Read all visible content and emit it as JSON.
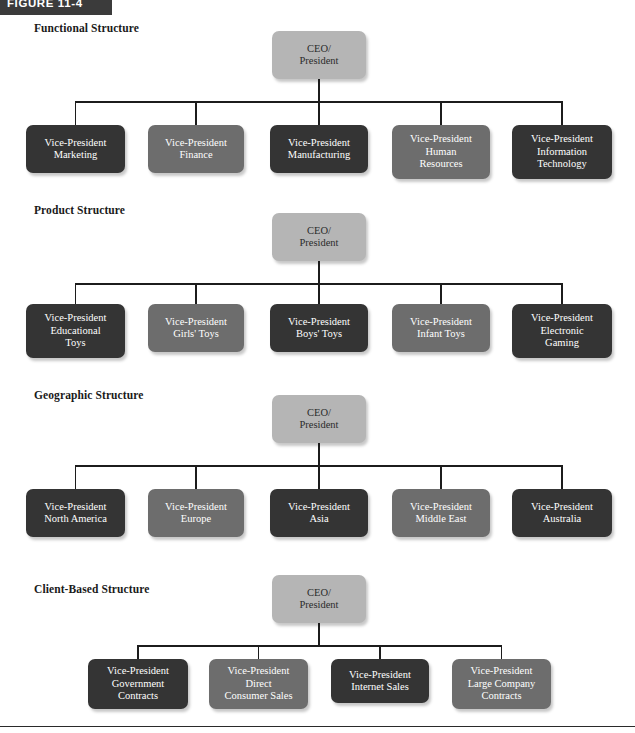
{
  "figure": {
    "label": "FIGURE 11-4"
  },
  "footer": {
    "rule": ""
  },
  "colors": {
    "ceo_box": "#b5b5b5",
    "dark_box": "#343434",
    "mid_box": "#6d6d6d",
    "connector_line": "#1c1c1c",
    "header_bar": "#3b3b3b",
    "page_background": "#ffffff"
  },
  "sections": [
    {
      "label": "Functional Structure",
      "root": {
        "line1": "CEO/",
        "line2": "President",
        "shade": "ceo"
      },
      "nodes": [
        {
          "line1": "Vice-President",
          "line2": "Marketing",
          "line3": "",
          "shade": "dark"
        },
        {
          "line1": "Vice-President",
          "line2": "Finance",
          "line3": "",
          "shade": "mid"
        },
        {
          "line1": "Vice-President",
          "line2": "Manufacturing",
          "line3": "",
          "shade": "dark"
        },
        {
          "line1": "Vice-President",
          "line2": "Human",
          "line3": "Resources",
          "shade": "mid"
        },
        {
          "line1": "Vice-President",
          "line2": "Information",
          "line3": "Technology",
          "shade": "dark"
        }
      ]
    },
    {
      "label": "Product Structure",
      "root": {
        "line1": "CEO/",
        "line2": "President",
        "shade": "ceo"
      },
      "nodes": [
        {
          "line1": "Vice-President",
          "line2": "Educational",
          "line3": "Toys",
          "shade": "dark"
        },
        {
          "line1": "Vice-President",
          "line2": "Girls' Toys",
          "line3": "",
          "shade": "mid"
        },
        {
          "line1": "Vice-President",
          "line2": "Boys' Toys",
          "line3": "",
          "shade": "dark"
        },
        {
          "line1": "Vice-President",
          "line2": "Infant Toys",
          "line3": "",
          "shade": "mid"
        },
        {
          "line1": "Vice-President",
          "line2": "Electronic",
          "line3": "Gaming",
          "shade": "dark"
        }
      ]
    },
    {
      "label": "Geographic Structure",
      "root": {
        "line1": "CEO/",
        "line2": "President",
        "shade": "ceo"
      },
      "nodes": [
        {
          "line1": "Vice-President",
          "line2": "North America",
          "line3": "",
          "shade": "dark"
        },
        {
          "line1": "Vice-President",
          "line2": "Europe",
          "line3": "",
          "shade": "mid"
        },
        {
          "line1": "Vice-President",
          "line2": "Asia",
          "line3": "",
          "shade": "dark"
        },
        {
          "line1": "Vice-President",
          "line2": "Middle East",
          "line3": "",
          "shade": "mid"
        },
        {
          "line1": "Vice-President",
          "line2": "Australia",
          "line3": "",
          "shade": "dark"
        }
      ]
    },
    {
      "label": "Client-Based Structure",
      "root": {
        "line1": "CEO/",
        "line2": "President",
        "shade": "ceo"
      },
      "nodes": [
        {
          "line1": "Vice-President",
          "line2": "Government",
          "line3": "Contracts",
          "shade": "dark"
        },
        {
          "line1": "Vice-President",
          "line2": "Direct",
          "line3": "Consumer Sales",
          "shade": "mid"
        },
        {
          "line1": "Vice-President",
          "line2": "Internet Sales",
          "line3": "",
          "shade": "dark"
        },
        {
          "line1": "Vice-President",
          "line2": "Large Company",
          "line3": "Contracts",
          "shade": "mid"
        }
      ]
    }
  ]
}
